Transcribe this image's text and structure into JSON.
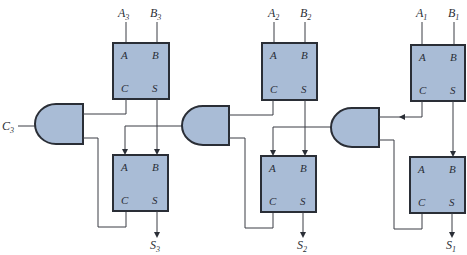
{
  "diagram": {
    "type": "logic-circuit",
    "colors": {
      "block_fill": "#a9bcd6",
      "outline": "#2a2e36",
      "wire": "#3a3d44",
      "background": "#ffffff"
    },
    "stages": [
      {
        "index": 3,
        "inputs": [
          {
            "base": "A",
            "sub": "3"
          },
          {
            "base": "B",
            "sub": "3"
          }
        ],
        "carry_in": {
          "base": "C",
          "sub": "3"
        },
        "output": {
          "base": "S",
          "sub": "3"
        },
        "upper_block": {
          "ports": [
            "A",
            "B",
            "C",
            "S"
          ]
        },
        "lower_block": {
          "ports": [
            "A",
            "B",
            "C",
            "S"
          ]
        }
      },
      {
        "index": 2,
        "inputs": [
          {
            "base": "A",
            "sub": "2"
          },
          {
            "base": "B",
            "sub": "2"
          }
        ],
        "output": {
          "base": "S",
          "sub": "2"
        },
        "upper_block": {
          "ports": [
            "A",
            "B",
            "C",
            "S"
          ]
        },
        "lower_block": {
          "ports": [
            "A",
            "B",
            "C",
            "S"
          ]
        }
      },
      {
        "index": 1,
        "inputs": [
          {
            "base": "A",
            "sub": "1"
          },
          {
            "base": "B",
            "sub": "1"
          }
        ],
        "output": {
          "base": "S",
          "sub": "1"
        },
        "upper_block": {
          "ports": [
            "A",
            "B",
            "C",
            "S"
          ]
        },
        "lower_block": {
          "ports": [
            "A",
            "B",
            "C",
            "S"
          ]
        }
      }
    ],
    "gates": [
      {
        "id": "gate-3",
        "kind": "AND"
      },
      {
        "id": "gate-2",
        "kind": "AND"
      },
      {
        "id": "gate-1",
        "kind": "AND"
      }
    ]
  }
}
